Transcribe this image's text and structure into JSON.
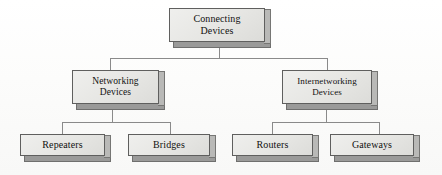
{
  "diagram": {
    "title": "Connecting Devices",
    "type": "hierarchy-tree",
    "background_color": "#fdfdfc",
    "box_fill_color": "#e6e6e3",
    "box_border_color": "#5f5f5e",
    "box_shadow_color": "#9a9a99",
    "connector_color": "#8a8a8a",
    "nodes": {
      "root": {
        "label": "Connecting\nDevices",
        "line1": "Connecting",
        "line2": "Devices"
      },
      "networking": {
        "label": "Networking\nDevices",
        "line1": "Networking",
        "line2": "Devices"
      },
      "internetworking": {
        "label": "Internetworking\nDevices",
        "line1": "Internetworking",
        "line2": "Devices"
      },
      "repeaters": {
        "label": "Repeaters"
      },
      "bridges": {
        "label": "Bridges"
      },
      "routers": {
        "label": "Routers"
      },
      "gateways": {
        "label": "Gateways"
      }
    },
    "levels": [
      {
        "name": "level-1",
        "items": [
          "Connecting Devices"
        ]
      },
      {
        "name": "level-2",
        "items": [
          "Networking Devices",
          "Internetworking Devices"
        ]
      },
      {
        "name": "level-3",
        "items": [
          "Repeaters",
          "Bridges",
          "Routers",
          "Gateways"
        ]
      }
    ]
  }
}
